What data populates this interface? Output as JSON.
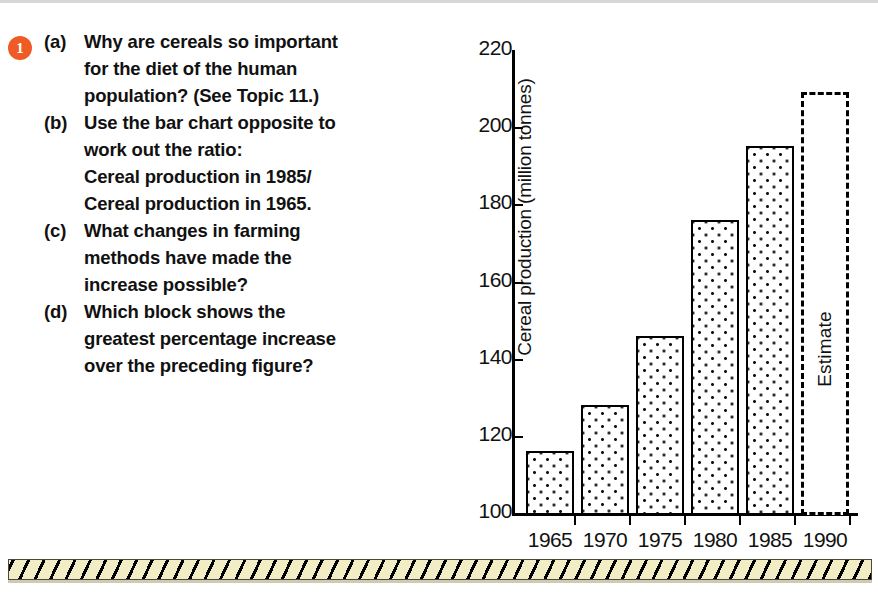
{
  "question": {
    "number": "1",
    "items": [
      {
        "label": "(a)",
        "lines": [
          "Why are cereals so important",
          "for the diet of the human",
          "population? (See Topic 11.)"
        ]
      },
      {
        "label": "(b)",
        "lines": [
          "Use the bar chart opposite to",
          "work out the ratio:",
          "Cereal production in 1985/",
          "Cereal production in 1965."
        ]
      },
      {
        "label": "(c)",
        "lines": [
          "What changes in farming",
          "methods have made the",
          "increase possible?"
        ]
      },
      {
        "label": "(d)",
        "lines": [
          "Which block shows the",
          "greatest percentage increase",
          "over the preceding figure?"
        ]
      }
    ]
  },
  "chart_data": {
    "type": "bar",
    "title": "",
    "xlabel": "",
    "ylabel": "Cereal production (million tonnes)",
    "categories": [
      "1965",
      "1970",
      "1975",
      "1980",
      "1985",
      "1990"
    ],
    "values": [
      116,
      128,
      146,
      176,
      195,
      209
    ],
    "ylim": [
      100,
      220
    ],
    "yticks": [
      "100",
      "120",
      "140",
      "160",
      "180",
      "200",
      "220"
    ],
    "grid": false,
    "legend": "none",
    "annotations": [
      {
        "text": "Estimate",
        "category": "1990",
        "note": "dashed outline bar, projected value"
      }
    ],
    "series_style": {
      "bars_filled": "stippled-dots",
      "estimate_bar": "dashed-outline-empty"
    }
  },
  "colors": {
    "bullet": "#ef5b25",
    "ink": "#111111",
    "band_fill": "#f2edc4"
  }
}
